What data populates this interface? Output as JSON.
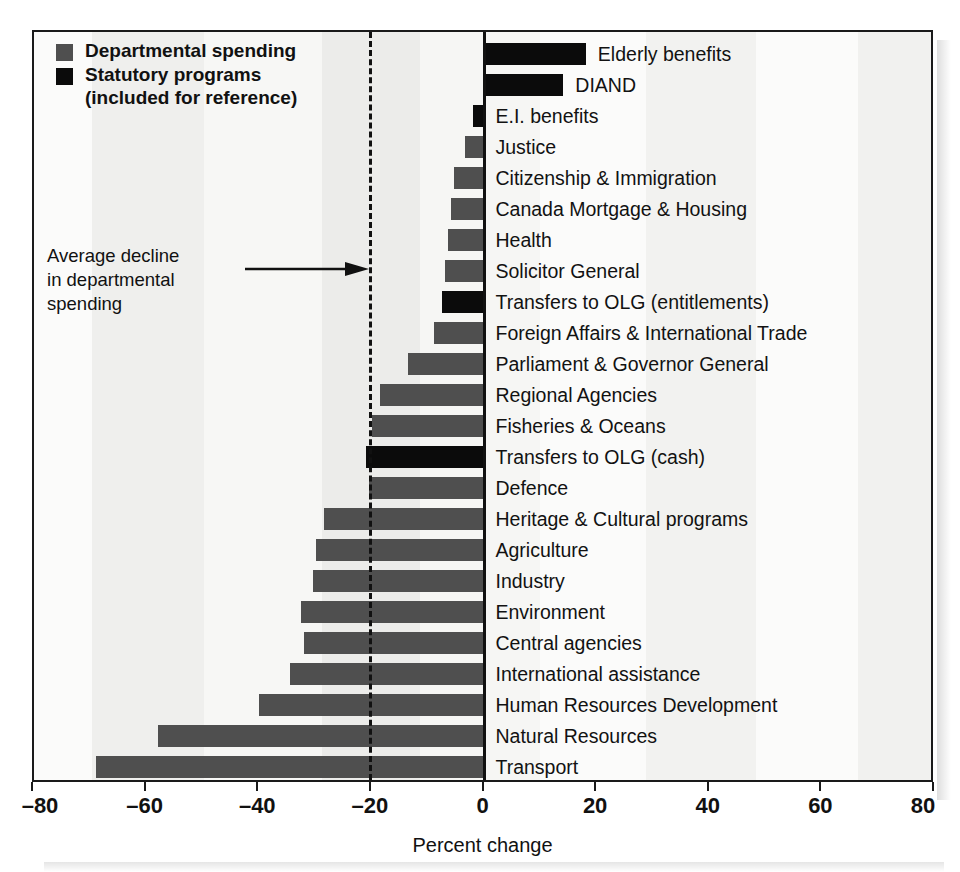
{
  "chart_data": {
    "type": "bar",
    "orientation": "horizontal",
    "title": "",
    "xlabel": "Percent change",
    "ylabel": "",
    "xlim": [
      -80,
      80
    ],
    "xticks": [
      -80,
      -60,
      -40,
      -20,
      0,
      20,
      40,
      60,
      80
    ],
    "xtick_labels": [
      "–80",
      "–60",
      "–40",
      "–20",
      "0",
      "20",
      "40",
      "60",
      "80"
    ],
    "grid": false,
    "legend_position": "top-left",
    "legend": [
      {
        "label": "Departmental spending",
        "color": "#4f4f4f",
        "key": "departmental"
      },
      {
        "label": "Statutory programs\n(included for reference)",
        "color": "#0b0b0b",
        "key": "statutory"
      }
    ],
    "annotations": [
      {
        "text": "Average decline\nin departmental\nspending",
        "points_to_value": -20.5,
        "arrow": true
      }
    ],
    "reference_lines": [
      {
        "value": 0,
        "style": "solid",
        "color": "#111111"
      },
      {
        "value": -20.5,
        "style": "dashed",
        "color": "#111111",
        "name": "average-decline"
      }
    ],
    "categories": [
      "Elderly benefits",
      "DIAND",
      "E.I. benefits",
      "Justice",
      "Citizenship & Immigration",
      "Canada Mortgage & Housing",
      "Health",
      "Solicitor General",
      "Transfers to OLG (entitlements)",
      "Foreign Affairs & International Trade",
      "Parliament & Governor General",
      "Regional Agencies",
      "Fisheries & Oceans",
      "Transfers to OLG (cash)",
      "Defence",
      "Heritage & Cultural programs",
      "Agriculture",
      "Industry",
      "Environment",
      "Central agencies",
      "International assistance",
      "Human Resources Development",
      "Natural Resources",
      "Transport"
    ],
    "values": [
      18,
      14,
      -2,
      -3.5,
      -5.5,
      -6,
      -6.5,
      -7,
      -7.5,
      -9,
      -13.5,
      -18.5,
      -20,
      -21,
      -20.5,
      -28.5,
      -30,
      -30.5,
      -32.5,
      -32,
      -34.5,
      -40,
      -58,
      -69
    ],
    "series_key": [
      "statutory",
      "statutory",
      "statutory",
      "departmental",
      "departmental",
      "departmental",
      "departmental",
      "departmental",
      "statutory",
      "departmental",
      "departmental",
      "departmental",
      "departmental",
      "statutory",
      "departmental",
      "departmental",
      "departmental",
      "departmental",
      "departmental",
      "departmental",
      "departmental",
      "departmental",
      "departmental",
      "departmental"
    ]
  }
}
